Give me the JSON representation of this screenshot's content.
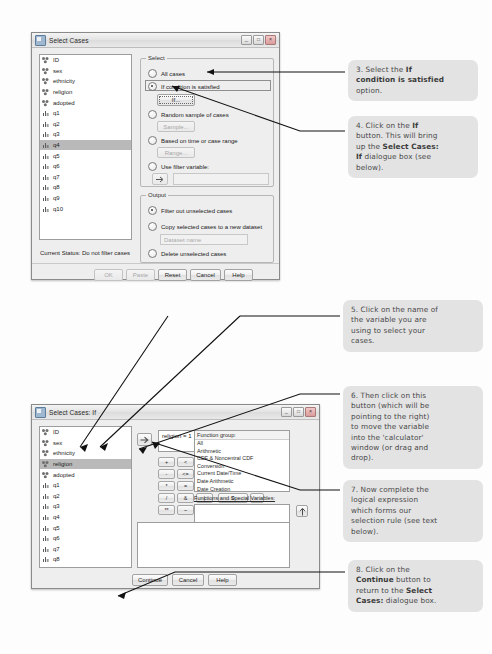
{
  "dialog1": {
    "title": "Select Cases",
    "window_controls": [
      "minimize",
      "maximize",
      "close"
    ],
    "variables": [
      {
        "name": "ID",
        "type": "nominal"
      },
      {
        "name": "sex",
        "type": "nominal"
      },
      {
        "name": "ethnicity",
        "type": "nominal"
      },
      {
        "name": "religion",
        "type": "nominal"
      },
      {
        "name": "adopted",
        "type": "nominal"
      },
      {
        "name": "q1",
        "type": "scale"
      },
      {
        "name": "q2",
        "type": "scale"
      },
      {
        "name": "q3",
        "type": "scale"
      },
      {
        "name": "q4",
        "type": "scale",
        "selected": true
      },
      {
        "name": "q5",
        "type": "scale"
      },
      {
        "name": "q6",
        "type": "scale"
      },
      {
        "name": "q7",
        "type": "scale"
      },
      {
        "name": "q8",
        "type": "scale"
      },
      {
        "name": "q9",
        "type": "scale"
      },
      {
        "name": "q10",
        "type": "scale"
      }
    ],
    "select_group": {
      "label": "Select",
      "options": [
        {
          "label": "All cases",
          "checked": false
        },
        {
          "label": "If condition is satisfied",
          "checked": true
        },
        {
          "label": "Random sample of cases",
          "checked": false
        },
        {
          "label": "Based on time or case range",
          "checked": false
        },
        {
          "label": "Use filter variable:",
          "checked": false
        }
      ],
      "if_button": "If...",
      "sample_button": "Sample...",
      "range_button": "Range...",
      "filter_value": ""
    },
    "output_group": {
      "label": "Output",
      "options": [
        {
          "label": "Filter out unselected cases",
          "checked": true
        },
        {
          "label": "Copy selected cases to a new dataset",
          "checked": false
        },
        {
          "label": "Delete unselected cases",
          "checked": false
        }
      ],
      "dataset_name_placeholder": "Dataset name"
    },
    "status": "Current Status: Do not filter cases",
    "buttons": [
      {
        "label": "OK",
        "disabled": true
      },
      {
        "label": "Paste",
        "disabled": true
      },
      {
        "label": "Reset",
        "disabled": false
      },
      {
        "label": "Cancel",
        "disabled": false
      },
      {
        "label": "Help",
        "disabled": false
      }
    ]
  },
  "dialog2": {
    "title": "Select Cases: If",
    "variables": [
      {
        "name": "ID",
        "type": "nominal"
      },
      {
        "name": "sex",
        "type": "nominal"
      },
      {
        "name": "ethnicity",
        "type": "nominal"
      },
      {
        "name": "religion",
        "type": "nominal",
        "selected": true
      },
      {
        "name": "adopted",
        "type": "nominal"
      },
      {
        "name": "q1",
        "type": "scale"
      },
      {
        "name": "q2",
        "type": "scale"
      },
      {
        "name": "q3",
        "type": "scale"
      },
      {
        "name": "q4",
        "type": "scale"
      },
      {
        "name": "q5",
        "type": "scale"
      },
      {
        "name": "q6",
        "type": "scale"
      },
      {
        "name": "q7",
        "type": "scale"
      },
      {
        "name": "q8",
        "type": "scale"
      },
      {
        "name": "q9",
        "type": "scale"
      },
      {
        "name": "q10",
        "type": "scale"
      }
    ],
    "move_button_icon": "arrow-right-icon",
    "expression": "religion = 1",
    "keypad": [
      [
        "+",
        "<",
        ">",
        "7",
        "8",
        "9"
      ],
      [
        "-",
        "<=",
        ">=",
        "4",
        "5",
        "6"
      ],
      [
        "*",
        "=",
        "~=",
        "1",
        "2",
        "3"
      ],
      [
        "/",
        "&",
        "|",
        "0",
        ""
      ],
      [
        "**",
        "~",
        "( )",
        "Delete"
      ]
    ],
    "keypad_delete_label": "Delete",
    "function_group_header": "Function group:",
    "function_groups": [
      "All",
      "Arithmetic",
      "CDF & Noncentral CDF",
      "Conversion",
      "Current Date/Time",
      "Date Arithmetic",
      "Date Creation",
      "Date Extraction"
    ],
    "functions_header": "Functions and Special Variables:",
    "up_button_icon": "arrow-up-icon",
    "buttons": [
      {
        "label": "Continue",
        "disabled": false
      },
      {
        "label": "Cancel",
        "disabled": false
      },
      {
        "label": "Help",
        "disabled": false
      }
    ]
  },
  "annotations": [
    {
      "id": 3,
      "html": "3. Select the <b>If</b><br><b>condition is satisfied</b><br>option."
    },
    {
      "id": 4,
      "html": "4. Click on the <b>If</b><br>button. This will bring<br>up the <b>Select Cases:</b><br><b>If</b> dialogue box (see<br>below)."
    },
    {
      "id": 5,
      "html": "5. Click on the name of<br>the variable you are<br>using to select your<br>cases."
    },
    {
      "id": 6,
      "html": "6. Then click on this<br>button (which will be<br>pointing to the right)<br>to move the variable<br>into the 'calculator'<br>window (or drag and<br>drop)."
    },
    {
      "id": 7,
      "html": "7. Now complete the<br>logical expression<br>which forms our<br>selection rule (see text<br>below)."
    },
    {
      "id": 8,
      "html": "8. Click on the<br><b>Continue</b> button to<br>return to the <b>Select</b><br><b>Cases:</b> dialogue box."
    }
  ]
}
